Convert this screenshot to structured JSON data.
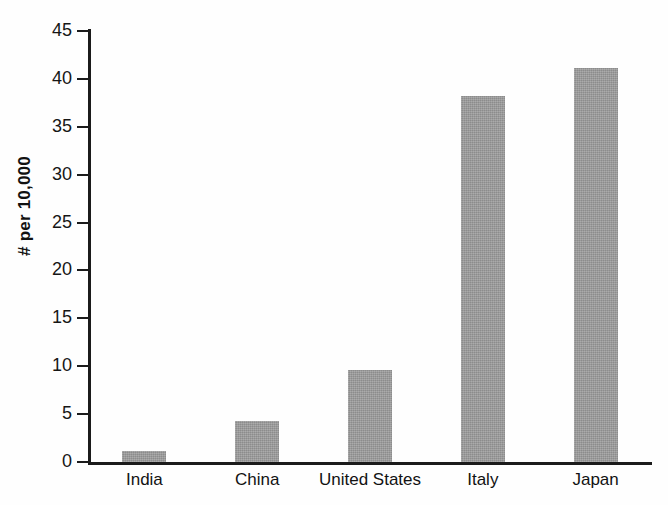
{
  "chart_data": {
    "type": "bar",
    "title": "",
    "subtitle": "",
    "xlabel": "",
    "ylabel": "# per 10,000",
    "categories": [
      "India",
      "China",
      "United States",
      "Italy",
      "Japan"
    ],
    "values": [
      1.2,
      4.3,
      9.6,
      38.2,
      41.1
    ],
    "series": [
      {
        "name": "# per 10,000",
        "values": [
          1.2,
          4.3,
          9.6,
          38.2,
          41.1
        ]
      }
    ],
    "ylim": [
      0,
      45
    ],
    "y_ticks": [
      0,
      5,
      10,
      15,
      20,
      25,
      30,
      35,
      40,
      45
    ],
    "y_tick_labels": [
      "0",
      "5",
      "10",
      "15",
      "20",
      "25",
      "30",
      "35",
      "40",
      "45"
    ],
    "grid": false,
    "legend": false,
    "legend_position": "none",
    "bar_color": "#989898",
    "axis_color": "#1b1b1b",
    "background_color": "#ffffff",
    "annotations": []
  }
}
